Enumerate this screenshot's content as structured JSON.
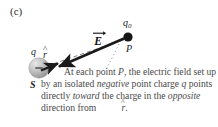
{
  "figure": {
    "panel_label": "(c)",
    "background_color": "#ffffff",
    "text_color": "#4a4a4a",
    "charge_sphere_color": "#b9b9b9",
    "vector_color": "#1a1a1a"
  },
  "labels": {
    "charge_q": "q",
    "unit_vector_r": "r",
    "unit_vector_r_accent": "^",
    "source_point_S": "S",
    "field_vector_E": "E",
    "field_vector_E_accent": "→",
    "test_charge_q0": "q",
    "test_charge_q0_subscript": "0",
    "field_point_P": "P",
    "charge_sign": "−"
  },
  "caption": {
    "line_1": "At each point ",
    "italic_P": "P",
    "line_1b": ", the electric field set up by an isolated ",
    "italic_negative": "negative",
    "line_2b": " point charge ",
    "italic_q": "q",
    "line_2c": " points directly ",
    "italic_toward": "toward",
    "line_3b": " the charge in the ",
    "italic_opposite": "opposite",
    "line_4b": " direction from ",
    "italic_r": "r",
    "line_4c": "."
  },
  "geometry": {
    "sphere_center_x": 39,
    "sphere_center_y": 68,
    "sphere_radius": 10,
    "field_point_x": 128,
    "field_point_y": 37,
    "field_point_radius": 4.5,
    "arrow_E_tail_x": 124,
    "arrow_E_tail_y": 38,
    "arrow_E_head_x": 57,
    "arrow_E_head_y": 67,
    "arrow_r_tail_x": 42,
    "arrow_r_tail_y": 70,
    "arrow_r_head_x": 59,
    "arrow_r_head_y": 64
  }
}
